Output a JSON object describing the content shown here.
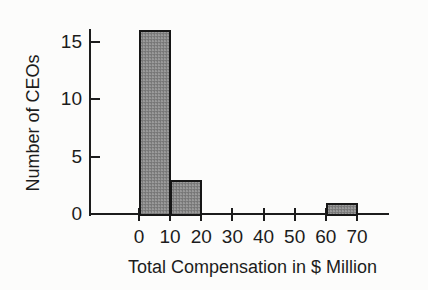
{
  "figure": {
    "background": "#fcfcfb"
  },
  "chart_data": {
    "type": "bar",
    "subtype": "histogram",
    "title": "",
    "xlabel": "Total Compensation in $ Million",
    "ylabel": "Number of CEOs",
    "x_ticks": [
      0,
      10,
      20,
      30,
      40,
      50,
      60,
      70
    ],
    "y_ticks": [
      0,
      5,
      10,
      15
    ],
    "xlim": [
      0,
      80
    ],
    "ylim": [
      0,
      16
    ],
    "bin_width": 10,
    "bins": [
      {
        "range": [
          0,
          10
        ],
        "count": 16
      },
      {
        "range": [
          10,
          20
        ],
        "count": 3
      },
      {
        "range": [
          20,
          30
        ],
        "count": 0
      },
      {
        "range": [
          30,
          40
        ],
        "count": 0
      },
      {
        "range": [
          40,
          50
        ],
        "count": 0
      },
      {
        "range": [
          50,
          60
        ],
        "count": 0
      },
      {
        "range": [
          60,
          70
        ],
        "count": 1
      }
    ],
    "grid": false,
    "legend": null,
    "colors": {
      "bar_fill": "#8e8e8e",
      "bar_border": "#161616",
      "axis": "#1c1c1c",
      "text": "#1c1c1c"
    }
  }
}
